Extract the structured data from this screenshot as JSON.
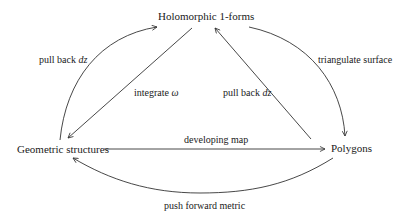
{
  "diagram": {
    "type": "commutative-diagram",
    "nodes": {
      "top": "Holomorphic 1-forms",
      "left": "Geometric structures",
      "right": "Polygons"
    },
    "edges": [
      {
        "id": "left-arc",
        "from": "Geometric structures",
        "to": "Holomorphic 1-forms",
        "label_text": "pull back ",
        "label_math": "dz"
      },
      {
        "id": "left-diagonal",
        "from": "Holomorphic 1-forms",
        "to": "Geometric structures",
        "label_text": "integrate ",
        "label_math": "ω"
      },
      {
        "id": "right-diagonal",
        "from": "Polygons",
        "to": "Holomorphic 1-forms",
        "label_text": "pull back ",
        "label_math": "dz"
      },
      {
        "id": "right-arc",
        "from": "Holomorphic 1-forms",
        "to": "Polygons",
        "label_text": "triangulate surface",
        "label_math": ""
      },
      {
        "id": "horizontal",
        "from": "Geometric structures",
        "to": "Polygons",
        "label_text": "developing map",
        "label_math": ""
      },
      {
        "id": "bottom-arc",
        "from": "Polygons",
        "to": "Geometric structures",
        "label_text": "push forward metric",
        "label_math": ""
      }
    ],
    "colors": {
      "stroke": "#333333",
      "text": "#1a1a1a",
      "background": "#ffffff"
    }
  }
}
